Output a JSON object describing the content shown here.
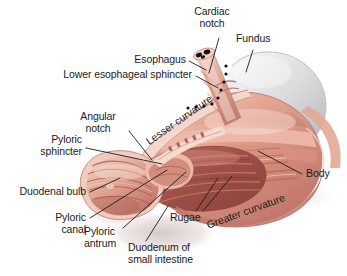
{
  "figure": {
    "background_color": "#ffffff",
    "width": 347,
    "height": 276
  },
  "palette": {
    "tissue_light": "#f3cdc2",
    "tissue_mid": "#e0a18f",
    "tissue_deep": "#c4766a",
    "tissue_dark": "#a85a52",
    "mucosa_dark": "#9e5048",
    "fundus_gray": "#cccccd",
    "fundus_gray_light": "#e9e9ea",
    "shadow": "#ded3d2",
    "outline": "#b58379",
    "label_text": "#1b1b1b",
    "leader_line": "#1b1b1b",
    "marker_dots": "#111111"
  },
  "labels": {
    "cardiac_notch_line1": "Cardiac",
    "cardiac_notch_line2": "notch",
    "fundus": "Fundus",
    "esophagus": "Esophagus",
    "lower_esophageal_sphincter": "Lower esophageal sphincter",
    "angular_notch_line1": "Angular",
    "angular_notch_line2": "notch",
    "pyloric_sphincter_line1": "Pyloric",
    "pyloric_sphincter_line2": "sphincter",
    "lesser_curvature": "Lesser curvature",
    "greater_curvature": "Greater curvature",
    "body": "Body",
    "duodenal_bulb": "Duodenal bulb",
    "pyloric_canal_line1": "Pyloric",
    "pyloric_canal_line2": "canal",
    "pyloric_antrum_line1": "Pyloric",
    "pyloric_antrum_line2": "antrum",
    "duodenum_line1": "Duodenum of",
    "duodenum_line2": "small intestine",
    "rugae": "Rugae"
  },
  "structures": [
    "Cardiac notch",
    "Fundus",
    "Esophagus",
    "Lower esophageal sphincter",
    "Angular notch",
    "Pyloric sphincter",
    "Lesser curvature",
    "Greater curvature",
    "Body",
    "Duodenal bulb",
    "Pyloric canal",
    "Pyloric antrum",
    "Duodenum of small intestine",
    "Rugae"
  ]
}
